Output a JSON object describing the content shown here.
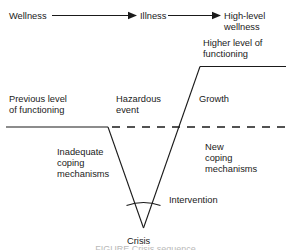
{
  "figure": {
    "colors": {
      "line": "#1a1a1a",
      "text": "#1a1a1a",
      "background": "#ffffff"
    },
    "top_flow": {
      "left_label": "Wellness",
      "middle_label": "Illness",
      "right_label_line1": "High-level",
      "right_label_line2": "wellness"
    },
    "labels": {
      "higher_level_line1": "Higher level of",
      "higher_level_line2": "functioning",
      "previous_level_line1": "Previous level",
      "previous_level_line2": "of functioning",
      "hazardous_line1": "Hazardous",
      "hazardous_line2": "event",
      "growth": "Growth",
      "inadequate_line1": "Inadequate",
      "inadequate_line2": "coping",
      "inadequate_line3": "mechanisms",
      "new_coping_line1": "New",
      "new_coping_line2": "coping",
      "new_coping_line3": "mechanisms",
      "intervention": "Intervention",
      "crisis": "Crisis"
    },
    "caption_cropped": "FIGURE   Crisis sequence"
  }
}
